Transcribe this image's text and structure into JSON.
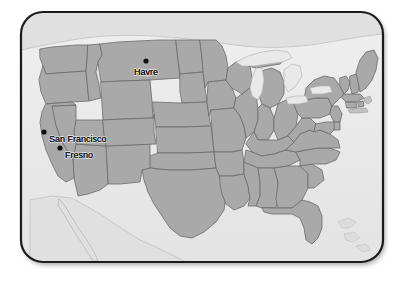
{
  "figure": {
    "kind": "map",
    "region": "contiguous-united-states",
    "frame": {
      "shape": "rounded-rectangle",
      "border_color": "#1c1c1c",
      "corner_radius_px": 22,
      "shadow": true
    },
    "colors": {
      "background": "#ffffff",
      "ocean": "#eaeaea",
      "land_outside_us": "#e4e4e4",
      "state_fill": "#a9a9a9",
      "state_border": "#6a6a6a",
      "coastline": "#7c7c7c",
      "marker": "#111111",
      "label_text": "#121212"
    }
  },
  "markers": [
    {
      "name": "Havre",
      "label": "Havre",
      "state": "Montana",
      "dot_x": 146,
      "dot_y": 61,
      "label_x": 146,
      "label_y": 75,
      "label_anchor": "middle"
    },
    {
      "name": "San Francisco",
      "label": "San Francisco",
      "state": "California",
      "dot_x": 44,
      "dot_y": 132,
      "label_x": 49,
      "label_y": 142,
      "label_anchor": "start"
    },
    {
      "name": "Fresno",
      "label": "Fresno",
      "state": "California",
      "dot_x": 60,
      "dot_y": 148,
      "label_x": 65,
      "label_y": 158,
      "label_anchor": "start"
    }
  ],
  "legend": {
    "present": false
  },
  "title": {
    "present": false,
    "text": ""
  }
}
